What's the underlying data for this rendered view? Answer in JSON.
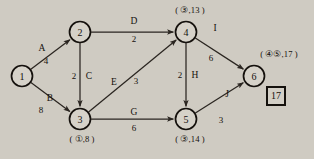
{
  "diagram": {
    "type": "directed-weighted-graph",
    "title": "",
    "nodes": [
      {
        "id": "1",
        "label": "1",
        "cx": 22,
        "cy": 76,
        "r": 10.5,
        "annotation": "",
        "annotation_x": 22,
        "annotation_y": 76
      },
      {
        "id": "2",
        "label": "2",
        "cx": 80,
        "cy": 32,
        "r": 10.5,
        "annotation": "",
        "annotation_x": 80,
        "annotation_y": 32
      },
      {
        "id": "3",
        "label": "3",
        "cx": 80,
        "cy": 119,
        "r": 10.5,
        "annotation": "( ①,8 )",
        "annotation_x": 82,
        "annotation_y": 139
      },
      {
        "id": "4",
        "label": "4",
        "cx": 186,
        "cy": 32,
        "r": 10.5,
        "annotation": "( ③,13 )",
        "annotation_x": 190,
        "annotation_y": 10
      },
      {
        "id": "5",
        "label": "5",
        "cx": 186,
        "cy": 119,
        "r": 10.5,
        "annotation": "( ③,14 )",
        "annotation_x": 190,
        "annotation_y": 139
      },
      {
        "id": "6",
        "label": "6",
        "cx": 254,
        "cy": 76,
        "r": 10.5,
        "annotation": "( ④⑤,17 )",
        "annotation_x": 279,
        "annotation_y": 54
      }
    ],
    "edges": [
      {
        "name": "A",
        "from": "1",
        "to": "2",
        "weight": "4",
        "name_x": 42,
        "name_y": 48,
        "weight_x": 46,
        "weight_y": 61
      },
      {
        "name": "B",
        "from": "1",
        "to": "3",
        "weight": "8",
        "name_x": 50,
        "name_y": 98,
        "weight_x": 41,
        "weight_y": 110
      },
      {
        "name": "C",
        "from": "2",
        "to": "3",
        "weight": "2",
        "name_x": 89,
        "name_y": 76,
        "weight_x": 74,
        "weight_y": 76
      },
      {
        "name": "D",
        "from": "2",
        "to": "4",
        "weight": "2",
        "name_x": 134,
        "name_y": 21,
        "weight_x": 134,
        "weight_y": 39
      },
      {
        "name": "E",
        "from": "3",
        "to": "4",
        "weight": "3",
        "name_x": 114,
        "name_y": 82,
        "weight_x": 136,
        "weight_y": 81
      },
      {
        "name": "G",
        "from": "3",
        "to": "5",
        "weight": "6",
        "name_x": 134,
        "name_y": 112,
        "weight_x": 134,
        "weight_y": 128
      },
      {
        "name": "H",
        "from": "4",
        "to": "5",
        "weight": "2",
        "name_x": 195,
        "name_y": 75,
        "weight_x": 180,
        "weight_y": 75
      },
      {
        "name": "I",
        "from": "4",
        "to": "6",
        "weight": "6",
        "name_x": 215,
        "name_y": 28,
        "weight_x": 211,
        "weight_y": 58
      },
      {
        "name": "J",
        "from": "5",
        "to": "6",
        "weight": "3",
        "name_x": 227,
        "name_y": 94,
        "weight_x": 221,
        "weight_y": 120
      }
    ],
    "answer_box": {
      "value": "17",
      "x": 266,
      "y": 86,
      "width": 20,
      "height": 20
    },
    "colors": {
      "background": "#cfcbc2",
      "stroke": "#15110d",
      "node_fill": "#d6d2c9",
      "text": "#15110d"
    }
  }
}
